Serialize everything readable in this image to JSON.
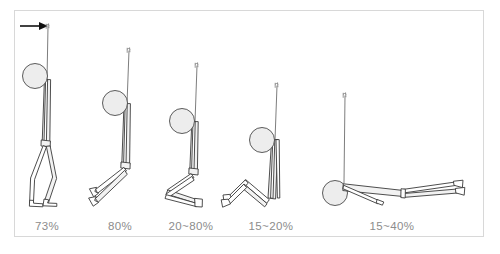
{
  "figure": {
    "title": "",
    "background_color": "#ffffff",
    "frame_color": "#d8d8d8",
    "label_color": "#8c8c8c",
    "line_color": "#3a3a3a",
    "head_fill_color": "#ededed",
    "arrow_color": "#111111",
    "annotation": {
      "arrow_name": "support-point-arrow",
      "arrow_direction": "right",
      "arrow_target": "rope-top"
    },
    "poses": [
      {
        "id": "pose-1",
        "label": "73%",
        "posture": "standing",
        "label_x": 47,
        "label_y": 219
      },
      {
        "id": "pose-2",
        "label": "80%",
        "posture": "leaning-legs-extended",
        "label_x": 120,
        "label_y": 219
      },
      {
        "id": "pose-3",
        "label": "20~80%",
        "posture": "kneeling",
        "label_x": 191,
        "label_y": 219
      },
      {
        "id": "pose-4",
        "label": "15~20%",
        "posture": "sitting-knees-bent",
        "label_x": 271,
        "label_y": 219
      },
      {
        "id": "pose-5",
        "label": "15~40%",
        "posture": "lying-horizontal",
        "label_x": 392,
        "label_y": 219
      }
    ]
  }
}
